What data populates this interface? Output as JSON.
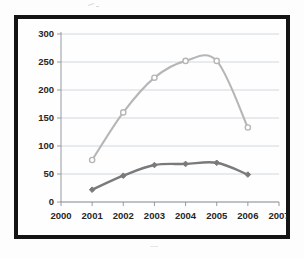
{
  "chart_data": {
    "type": "line",
    "title": "",
    "subtitle": "",
    "xlabel": "",
    "ylabel": "",
    "x": [
      2001,
      2002,
      2003,
      2004,
      2005,
      2006
    ],
    "xlim": [
      2000,
      2007
    ],
    "ylim": [
      0,
      300
    ],
    "grid": true,
    "legend_position": "none",
    "x_tick_labels": [
      "2000",
      "2001",
      "2002",
      "2003",
      "2004",
      "2005",
      "2006",
      "2007"
    ],
    "y_tick_labels": [
      "0",
      "50",
      "100",
      "150",
      "200",
      "250",
      "300"
    ],
    "y_ticks": [
      0,
      50,
      100,
      150,
      200,
      250,
      300
    ],
    "x_ticks": [
      2000,
      2001,
      2002,
      2003,
      2004,
      2005,
      2006,
      2007
    ],
    "series": [
      {
        "name": "series-upper",
        "color": "#b6b6b6",
        "marker": "circle",
        "smoothed": true,
        "values": [
          75,
          160,
          222,
          252,
          252,
          133
        ]
      },
      {
        "name": "series-lower",
        "color": "#7a7a7a",
        "marker": "diamond",
        "smoothed": true,
        "values": [
          22,
          47,
          66,
          68,
          70,
          49
        ]
      }
    ],
    "annotations": []
  },
  "figure": {
    "frame_color": "#141414",
    "plot_background": "#ffffff",
    "gridline_color": "#c9cfd6",
    "axis_color": "#8b9097"
  }
}
